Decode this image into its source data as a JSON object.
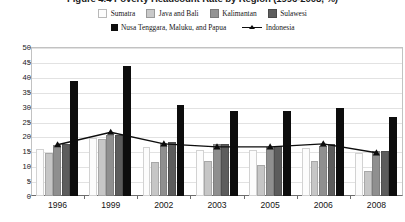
{
  "chart_data": {
    "type": "bar",
    "title": "Figure 4.4 Poverty Headcount Rate by Region (1996-2008, %)",
    "xlabel": "",
    "ylabel": "",
    "ylim": [
      0,
      50
    ],
    "ytick_step": 5,
    "grid": true,
    "legend_position": "top",
    "categories": [
      "1996",
      "1999",
      "2002",
      "2003",
      "2005",
      "2006",
      "2008"
    ],
    "yticks": [
      "50",
      "45",
      "40",
      "35",
      "30",
      "25",
      "20",
      "15",
      "10",
      "5",
      "0"
    ],
    "series": [
      {
        "name": "Sumatra",
        "kind": "bar",
        "color": "#fcfcfc",
        "values": [
          15.8,
          19.5,
          16.3,
          15.6,
          15.5,
          16.2,
          14.5
        ]
      },
      {
        "name": "Java and Bali",
        "kind": "bar",
        "color": "#c6c6c6",
        "values": [
          14.3,
          19.3,
          11.4,
          11.6,
          10.4,
          11.7,
          8.4
        ]
      },
      {
        "name": "Kalimantan",
        "kind": "bar",
        "color": "#8f8f8f",
        "values": [
          17.2,
          20.4,
          17.8,
          17.3,
          16.4,
          16.8,
          15.0
        ]
      },
      {
        "name": "Sulawesi",
        "kind": "bar",
        "color": "#5c5c5c",
        "values": [
          17.5,
          20.5,
          18.2,
          17.5,
          16.7,
          17.3,
          15.2
        ]
      },
      {
        "name": "Nusa Tenggara, Maluku, and Papua",
        "kind": "bar",
        "color": "#0d0d0d",
        "values": [
          38.5,
          43.5,
          30.5,
          28.5,
          28.5,
          29.5,
          26.5
        ]
      },
      {
        "name": "Indonesia",
        "kind": "line",
        "color": "#0d0d0d",
        "marker": "triangle",
        "values": [
          17.2,
          21.4,
          17.5,
          16.5,
          16.5,
          17.5,
          14.5
        ]
      }
    ]
  },
  "legend": {
    "row1": [
      "Sumatra",
      "Java and Bali",
      "Kalimantan",
      "Sulawesi"
    ],
    "row2": [
      "Nusa Tenggara, Maluku, and Papua",
      "Indonesia"
    ]
  }
}
